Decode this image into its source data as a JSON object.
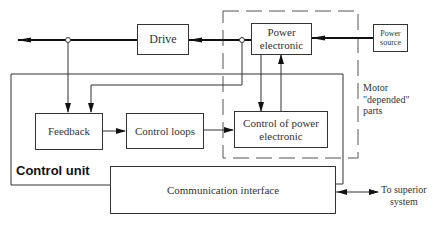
{
  "diagram": {
    "type": "block-diagram",
    "nodes": {
      "drive": "Drive",
      "power_electronic": "Power electronic",
      "power_electronic_line1": "Power",
      "power_electronic_line2": "electronic",
      "power_source_line1": "Power",
      "power_source_line2": "source",
      "feedback": "Feedback",
      "control_loops": "Control loops",
      "control_pe_line1": "Control of power",
      "control_pe_line2": "electronic",
      "communication_interface": "Communication interface"
    },
    "groups": {
      "control_unit": "Control unit",
      "motor_parts_line1": "Motor",
      "motor_parts_line2": "\"depended\"",
      "motor_parts_line3": "parts"
    },
    "external": {
      "superior_line1": "To superior",
      "superior_line2": "system"
    },
    "edges": [
      {
        "from": "Power source",
        "to": "Power electronic"
      },
      {
        "from": "Power electronic",
        "to": "Drive"
      },
      {
        "from": "Drive",
        "to": "Output"
      },
      {
        "from": "Output tap",
        "to": "Feedback"
      },
      {
        "from": "Power electronic tap",
        "to": "Feedback"
      },
      {
        "from": "Feedback",
        "to": "Control loops"
      },
      {
        "from": "Control loops",
        "to": "Control of power electronic"
      },
      {
        "from": "Power electronic",
        "to": "Control of power electronic"
      },
      {
        "from": "Control of power electronic",
        "to": "Power electronic"
      },
      {
        "from": "Communication interface",
        "to": "To superior system",
        "bidirectional": true
      }
    ],
    "colors": {
      "line": "#333333",
      "dashed": "#555555",
      "background": "#ffffff"
    }
  }
}
